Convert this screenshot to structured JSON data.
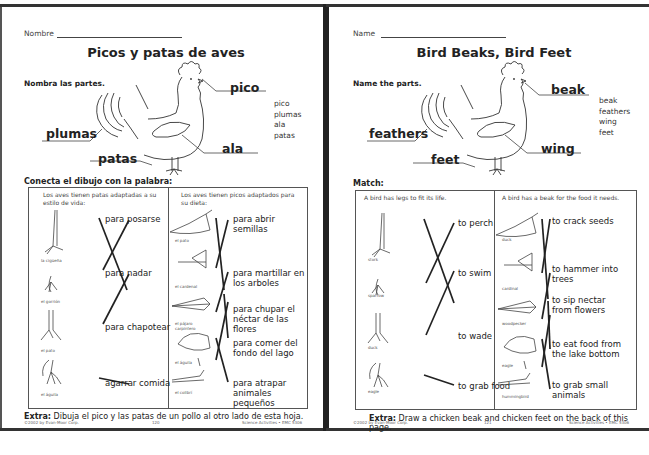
{
  "pages": [
    {
      "lang": "es",
      "name_label": "Nombre",
      "title": "Picos y patas de aves",
      "name_parts_heading": "Nombra las partes.",
      "part_labels": {
        "beak": "pico",
        "feathers": "plumas",
        "wing": "ala",
        "feet": "patas"
      },
      "word_bank": [
        "pico",
        "plumas",
        "ala",
        "patas"
      ],
      "match_heading": "Conecta el dibujo con la palabra:",
      "legs_column": {
        "heading": "Los aves tienen patas adaptadas a su estilo de vida:",
        "birds": [
          "la cigüeña",
          "el gorrión",
          "el pato",
          "el águila"
        ],
        "answers": [
          "para posarse",
          "para nadar",
          "para chapotear",
          "agarrar comida"
        ]
      },
      "beaks_column": {
        "heading": "Los aves tienen picos adaptados para su dieta:",
        "birds": [
          "el pato",
          "el cardenal",
          "el pájaro carpintero",
          "el águila",
          "el colibrí"
        ],
        "answers": [
          "para abrir semillas",
          "para martillar en los arboles",
          "para chupar el néctar de las flores",
          "para comer del fondo del lago",
          "para atrapar animales pequeños"
        ]
      },
      "extra_label": "Extra:",
      "extra_text": "Dibuja el pico y las patas de un pollo al otro lado de esta hoja.",
      "footer": {
        "copyright": "©2002 by Evan-Moor Corp.",
        "page_number": "120",
        "series": "Science Activities • EMC 5306"
      }
    },
    {
      "lang": "en",
      "name_label": "Name",
      "title": "Bird Beaks, Bird Feet",
      "name_parts_heading": "Name the parts.",
      "part_labels": {
        "beak": "beak",
        "feathers": "feathers",
        "wing": "wing",
        "feet": "feet"
      },
      "word_bank": [
        "beak",
        "feathers",
        "wing",
        "feet"
      ],
      "match_heading": "Match:",
      "legs_column": {
        "heading": "A bird has legs to fit its life.",
        "birds": [
          "stork",
          "sparrow",
          "duck",
          "eagle"
        ],
        "answers": [
          "to perch",
          "to swim",
          "to wade",
          "to grab food"
        ]
      },
      "beaks_column": {
        "heading": "A bird has a beak for the food it needs.",
        "birds": [
          "duck",
          "cardinal",
          "woodpecker",
          "eagle",
          "hummingbird"
        ],
        "answers": [
          "to crack seeds",
          "to hammer into trees",
          "to sip nectar from flowers",
          "to eat food from the lake bottom",
          "to grab small animals"
        ]
      },
      "extra_label": "Extra:",
      "extra_text": "Draw a chicken beak and chicken feet on the back of this page.",
      "footer": {
        "copyright": "©2002 by Evan-Moor Corp.",
        "page_number": "121",
        "series": "Science Activities • EMC 5306"
      }
    }
  ]
}
